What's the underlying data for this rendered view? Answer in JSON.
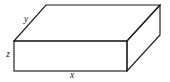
{
  "figure": {
    "type": "rectangular-box-oblique-projection",
    "canvas": {
      "width": 170,
      "height": 82,
      "background": "#ffffff"
    },
    "stroke_color": "#1a1a1a",
    "stroke_width": 1.15,
    "face_color": "#ffffff"
  },
  "vertices": {
    "front_top_left": {
      "x": 14,
      "y": 41
    },
    "front_top_right": {
      "x": 127,
      "y": 41
    },
    "front_bottom_left": {
      "x": 14,
      "y": 71
    },
    "front_bottom_right": {
      "x": 127,
      "y": 71
    },
    "back_top_left": {
      "x": 46,
      "y": 5
    },
    "back_top_right": {
      "x": 160,
      "y": 5
    },
    "back_bottom_right": {
      "x": 160,
      "y": 35
    }
  },
  "paths": {
    "top_face": "14,41 46,5 160,5 127,41",
    "right_face": "127,41 160,5 160,35 127,71",
    "front_face": "14,41 127,41 127,71 14,71",
    "front_face_rect": {
      "x": 14,
      "y": 41,
      "width": 113,
      "height": 30
    }
  },
  "labels": {
    "depth": {
      "text": "y",
      "x": 26,
      "y": 20
    },
    "height": {
      "text": "z",
      "x": 8,
      "y": 55
    },
    "width": {
      "text": "x",
      "x": 72,
      "y": 76
    }
  }
}
